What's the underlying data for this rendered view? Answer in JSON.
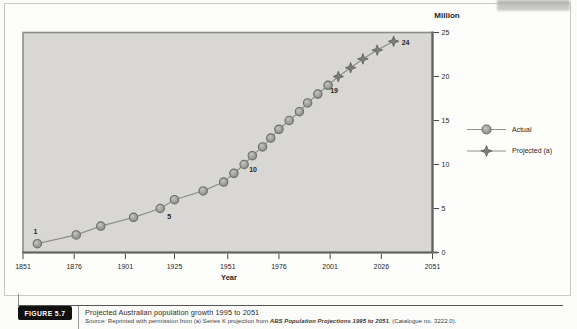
{
  "colors": {
    "plot_fill": "#d8d7d4",
    "plot_border": "#8d8d8b",
    "axis": "#62625f",
    "tick": "#4a4a48",
    "line": "#8f8f8d",
    "circle_edge": "#6d6d6b",
    "star_fill": "#7c7c7a",
    "star_edge": "#5e5e5c",
    "text": "#262624",
    "badge_bg": "#111110",
    "badge_text": "#ffffff"
  },
  "chart_data": {
    "type": "line",
    "title": "Projected Australian population growth 1995 to 2051",
    "xlabel": "Year",
    "ylabel": "Million",
    "xlim": [
      1851,
      2051
    ],
    "ylim": [
      0,
      25
    ],
    "x_ticks": [
      "1851",
      "1876",
      "1901",
      "1925",
      "1951",
      "1976",
      "2001",
      "2026",
      "2051"
    ],
    "x_tick_years": [
      1851,
      1876,
      1901,
      1925,
      1951,
      1976,
      2001,
      2026,
      2051
    ],
    "y_ticks": [
      0,
      5,
      10,
      15,
      20,
      25
    ],
    "grid": false,
    "legend_position": "right-outside",
    "series": [
      {
        "name": "Actual",
        "marker": "circle",
        "points": [
          {
            "x": 1858,
            "y": 1
          },
          {
            "x": 1877,
            "y": 2
          },
          {
            "x": 1889,
            "y": 3
          },
          {
            "x": 1905,
            "y": 4
          },
          {
            "x": 1918,
            "y": 5
          },
          {
            "x": 1925,
            "y": 6
          },
          {
            "x": 1939,
            "y": 7
          },
          {
            "x": 1949,
            "y": 8
          },
          {
            "x": 1954,
            "y": 9
          },
          {
            "x": 1959,
            "y": 10
          },
          {
            "x": 1963,
            "y": 11
          },
          {
            "x": 1968,
            "y": 12
          },
          {
            "x": 1972,
            "y": 13
          },
          {
            "x": 1976,
            "y": 14
          },
          {
            "x": 1981,
            "y": 15
          },
          {
            "x": 1986,
            "y": 16
          },
          {
            "x": 1990,
            "y": 17
          },
          {
            "x": 1995,
            "y": 18
          },
          {
            "x": 2000,
            "y": 19
          }
        ]
      },
      {
        "name": "Projected (a)",
        "marker": "star4",
        "points": [
          {
            "x": 2005,
            "y": 20
          },
          {
            "x": 2011,
            "y": 21
          },
          {
            "x": 2017,
            "y": 22
          },
          {
            "x": 2024,
            "y": 23
          },
          {
            "x": 2032,
            "y": 24
          }
        ]
      }
    ],
    "point_labels": [
      {
        "text": "1",
        "x": 1858,
        "y": 1,
        "dx": -2,
        "dy": -12
      },
      {
        "text": "5",
        "x": 1918,
        "y": 5,
        "dx": 9,
        "dy": 8
      },
      {
        "text": "10",
        "x": 1959,
        "y": 10,
        "dx": 9,
        "dy": 5
      },
      {
        "text": "19",
        "x": 2000,
        "y": 19,
        "dx": 6,
        "dy": 5
      },
      {
        "text": "24",
        "x": 2032,
        "y": 24,
        "dx": 12,
        "dy": 1
      }
    ]
  },
  "legend": {
    "items": [
      {
        "label": "Actual",
        "marker": "circle"
      },
      {
        "label": "Projected (a)",
        "marker": "star4"
      }
    ]
  },
  "caption": {
    "figure_label": "FIGURE 5.7",
    "title": "Projected Australian population growth 1995 to 2051",
    "source_prefix": "Source:",
    "source_text": " Reprinted with permission from (a) Series K projection from ",
    "source_italic": "ABS Population Projections 1995 to 2051",
    "source_suffix": ", (Catalogue no. 3222.0)."
  }
}
